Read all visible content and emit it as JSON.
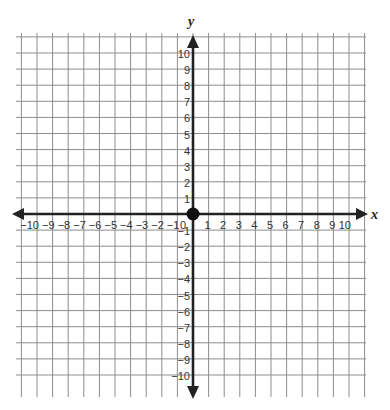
{
  "diagram": {
    "type": "coordinate-plane",
    "x_axis": {
      "label": "x",
      "min": -10,
      "max": 10,
      "ticks": [
        -10,
        -9,
        -8,
        -7,
        -6,
        -5,
        -4,
        -3,
        -2,
        -1,
        1,
        2,
        3,
        4,
        5,
        6,
        7,
        8,
        9,
        10
      ]
    },
    "y_axis": {
      "label": "y",
      "min": -10,
      "max": 10,
      "ticks": [
        10,
        9,
        8,
        7,
        6,
        5,
        4,
        3,
        2,
        1,
        -1,
        -2,
        -3,
        -4,
        -5,
        -6,
        -7,
        -8,
        -9,
        -10
      ]
    },
    "origin_label": "0",
    "origin_point": {
      "x": 0,
      "y": 0,
      "color": "#111111"
    },
    "grid": {
      "visible": true,
      "step": 1,
      "color": "#8c8c8c"
    },
    "axis_color": "#222222"
  }
}
